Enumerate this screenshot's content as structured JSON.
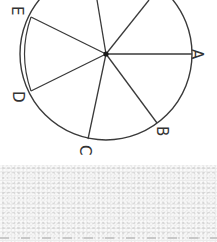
{
  "diagram": {
    "type": "circle-radii",
    "rotation_deg": 90,
    "center": {
      "x": 106,
      "y": 54
    },
    "radius": 86,
    "stroke_color": "#3a3a3a",
    "points": [
      {
        "id": "A",
        "label": "A",
        "end": {
          "x": 192,
          "y": 54
        },
        "label_pos": {
          "x": 197,
          "y": 55
        }
      },
      {
        "id": "B",
        "label": "B",
        "end": {
          "x": 157,
          "y": 123
        },
        "label_pos": {
          "x": 163,
          "y": 133
        }
      },
      {
        "id": "C",
        "label": "C",
        "end": {
          "x": 88,
          "y": 139
        },
        "label_pos": {
          "x": 86,
          "y": 152
        }
      },
      {
        "id": "D",
        "label": "D",
        "end": {
          "x": 31,
          "y": 91
        },
        "label_pos": {
          "x": 19,
          "y": 97
        }
      },
      {
        "id": "E",
        "label": "E",
        "end": {
          "x": 31,
          "y": 17
        },
        "label_pos": {
          "x": 17,
          "y": 11
        }
      }
    ],
    "unlabeled_radii": [
      {
        "end": {
          "x": 97,
          "y": 0
        }
      },
      {
        "end": {
          "x": 149,
          "y": 0
        }
      }
    ],
    "double_arc": {
      "from": "E",
      "to": "D"
    }
  },
  "background": {
    "noise_color": "#ebebeb",
    "dash_color": "#c8c8c8"
  }
}
